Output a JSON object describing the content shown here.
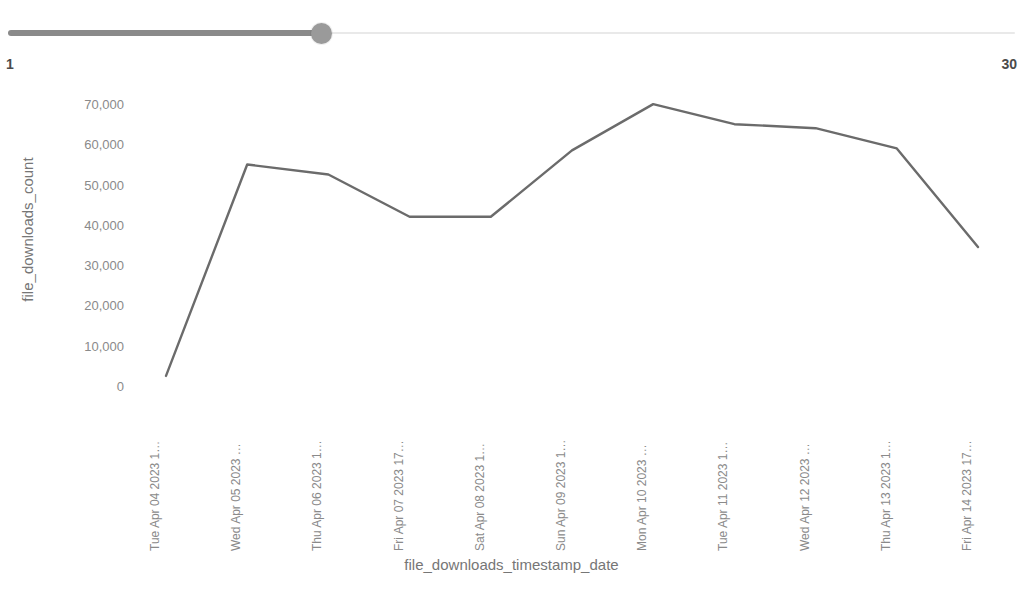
{
  "slider": {
    "name": "range-slider",
    "current_value": "10",
    "min_label": "1",
    "max_label": "30",
    "min": 1,
    "max": 30,
    "value": 10,
    "fill_color": "#8a8a8a",
    "handle_color": "#9a9a9a",
    "track_color": "#e9e9e9"
  },
  "chart_data": {
    "type": "line",
    "title": "",
    "xlabel": "file_downloads_timestamp_date",
    "ylabel": "file_downloads_count",
    "ylim": [
      0,
      72000
    ],
    "y_ticks": [
      0,
      10000,
      20000,
      30000,
      40000,
      50000,
      60000,
      70000
    ],
    "y_tick_labels": [
      "0",
      "10,000",
      "20,000",
      "30,000",
      "40,000",
      "50,000",
      "60,000",
      "70,000"
    ],
    "grid": false,
    "legend": "none",
    "line_color": "#6b6b6b",
    "line_width": 2.4,
    "categories": [
      "Tue Apr 04 2023 1…",
      "Wed Apr 05 2023 …",
      "Thu Apr 06 2023 1…",
      "Fri Apr 07 2023 17…",
      "Sat Apr 08 2023 1…",
      "Sun Apr 09 2023 1…",
      "Mon Apr 10 2023 …",
      "Tue Apr 11 2023 1…",
      "Wed Apr 12 2023 …",
      "Thu Apr 13 2023 1…",
      "Fri Apr 14 2023 17…"
    ],
    "values": [
      2500,
      55000,
      52500,
      42000,
      42000,
      58500,
      70000,
      65000,
      64000,
      59000,
      34500
    ]
  }
}
